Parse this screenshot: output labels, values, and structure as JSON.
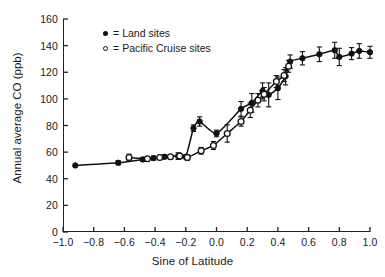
{
  "chart_data": {
    "type": "line",
    "title": "",
    "xlabel": "Sine of Latitude",
    "ylabel": "Annual average CO (ppb)",
    "xlim": [
      -1.0,
      1.0
    ],
    "ylim": [
      0,
      160
    ],
    "xticks": [
      "-1.0",
      "-0.8",
      "-0.6",
      "-0.4",
      "-0.2",
      "0.0",
      "0.2",
      "0.4",
      "0.6",
      "0.8",
      "1.0"
    ],
    "xtick_values": [
      -1.0,
      -0.8,
      -0.6,
      -0.4,
      -0.2,
      0.0,
      0.2,
      0.4,
      0.6,
      0.8,
      1.0
    ],
    "yticks": [
      "0",
      "20",
      "40",
      "60",
      "80",
      "100",
      "120",
      "140",
      "160"
    ],
    "ytick_values": [
      0,
      20,
      40,
      60,
      80,
      100,
      120,
      140,
      160
    ],
    "grid": false,
    "legend_position": "top-left-inside",
    "series": [
      {
        "name": "Land sites",
        "marker": "filled-circle",
        "marker_color": "#111111",
        "line_color": "#111111",
        "points": [
          {
            "x": -0.92,
            "y": 50,
            "err": 0
          },
          {
            "x": -0.64,
            "y": 52,
            "err": 1.5
          },
          {
            "x": -0.48,
            "y": 54.5,
            "err": 1.5
          },
          {
            "x": -0.41,
            "y": 55.5,
            "err": 1.5
          },
          {
            "x": -0.34,
            "y": 56.5,
            "err": 1.5
          },
          {
            "x": -0.25,
            "y": 57,
            "err": 2.5
          },
          {
            "x": -0.2,
            "y": 56.5,
            "err": 1.5
          },
          {
            "x": -0.15,
            "y": 78,
            "err": 2.5
          },
          {
            "x": -0.11,
            "y": 83,
            "err": 3.5
          },
          {
            "x": 0.0,
            "y": 74,
            "err": 2.5
          },
          {
            "x": 0.16,
            "y": 92.5,
            "err": 5.5
          },
          {
            "x": 0.23,
            "y": 97,
            "err": 7.0
          },
          {
            "x": 0.3,
            "y": 106,
            "err": 6.0
          },
          {
            "x": 0.34,
            "y": 103,
            "err": 9.0
          },
          {
            "x": 0.4,
            "y": 108,
            "err": 8.5
          },
          {
            "x": 0.45,
            "y": 117,
            "err": 6.5
          },
          {
            "x": 0.48,
            "y": 128,
            "err": 5.0
          },
          {
            "x": 0.56,
            "y": 130.5,
            "err": 5.0
          },
          {
            "x": 0.67,
            "y": 133.5,
            "err": 5.5
          },
          {
            "x": 0.77,
            "y": 136.5,
            "err": 6.0
          },
          {
            "x": 0.8,
            "y": 131.5,
            "err": 6.5
          },
          {
            "x": 0.88,
            "y": 134,
            "err": 4.5
          },
          {
            "x": 0.93,
            "y": 136,
            "err": 5.5
          },
          {
            "x": 1.0,
            "y": 135,
            "err": 4.5
          }
        ]
      },
      {
        "name": "Pacific Cruise sites",
        "marker": "open-circle",
        "marker_color": "#111111",
        "line_color": "#111111",
        "points": [
          {
            "x": -0.57,
            "y": 56,
            "err": 2.5
          },
          {
            "x": -0.45,
            "y": 55,
            "err": 1.5
          },
          {
            "x": -0.37,
            "y": 56,
            "err": 1.5
          },
          {
            "x": -0.3,
            "y": 56.5,
            "err": 1.5
          },
          {
            "x": -0.24,
            "y": 57,
            "err": 2.0
          },
          {
            "x": -0.19,
            "y": 56,
            "err": 2.0
          },
          {
            "x": -0.1,
            "y": 61,
            "err": 2.5
          },
          {
            "x": -0.02,
            "y": 65,
            "err": 3.0
          },
          {
            "x": 0.07,
            "y": 74,
            "err": 6.5
          },
          {
            "x": 0.16,
            "y": 83,
            "err": 3.5
          },
          {
            "x": 0.22,
            "y": 91.5,
            "err": 5.5
          },
          {
            "x": 0.27,
            "y": 99,
            "err": 5.0
          },
          {
            "x": 0.31,
            "y": 103.5,
            "err": 5.0
          },
          {
            "x": 0.39,
            "y": 113,
            "err": 4.5
          },
          {
            "x": 0.44,
            "y": 117.5,
            "err": 4.5
          },
          {
            "x": 0.47,
            "y": 124.5,
            "err": 4.5
          }
        ]
      }
    ],
    "annotations": [
      "Land sites show a pronounced local maximum near sine of latitude -0.11 (about 83 ppb) followed by a dip to about 74 ppb at the equator.",
      "Both series converge above sine of latitude 0.45 onto a northern plateau near 130-137 ppb."
    ]
  },
  "legend": {
    "entries": [
      {
        "equals": "=",
        "label": "Land sites",
        "marker": "filled-circle"
      },
      {
        "equals": "=",
        "label": "Pacific Cruise sites",
        "marker": "open-circle"
      }
    ]
  }
}
